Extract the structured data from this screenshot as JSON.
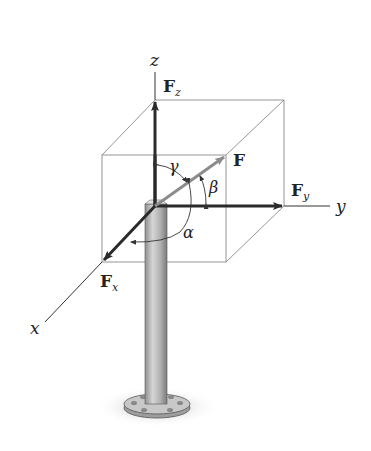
{
  "figure": {
    "axes": {
      "x": "x",
      "y": "y",
      "z": "z"
    },
    "vectors": {
      "resultant": "F",
      "fx": {
        "main": "F",
        "sub": "x"
      },
      "fy": {
        "main": "F",
        "sub": "y"
      },
      "fz": {
        "main": "F",
        "sub": "z"
      }
    },
    "angles": {
      "alpha": "α",
      "beta": "β",
      "gamma": "γ"
    },
    "colors": {
      "component_arrow": "#2a2a2a",
      "resultant_arrow": "#8c8c8c",
      "box_edge": "#8a8a8a",
      "post": "#b9b9b9"
    }
  }
}
